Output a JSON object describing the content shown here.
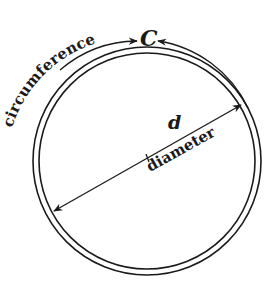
{
  "diagram": {
    "labels": {
      "circumference_word": "circumference",
      "circumference_symbol": "C",
      "diameter_symbol": "d",
      "diameter_word": "diameter"
    },
    "colors": {
      "stroke": "#1a1a1a",
      "background": "#ffffff"
    }
  }
}
